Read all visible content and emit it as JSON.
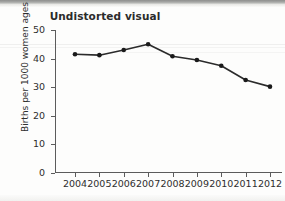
{
  "chart_data": {
    "type": "line",
    "title": "Undistorted visual",
    "xlabel": "",
    "ylabel": "Births per 1000 women ages 15-19",
    "categories": [
      "2004",
      "2005",
      "2006",
      "2007",
      "2008",
      "2009",
      "2010",
      "2011",
      "2012"
    ],
    "values": [
      41.5,
      41.2,
      43.0,
      45.0,
      40.8,
      39.5,
      37.5,
      32.5,
      30.2
    ],
    "ylim": [
      0,
      50
    ],
    "yticks": [
      0,
      10,
      20,
      30,
      40,
      50
    ],
    "ytick_labels": [
      "0",
      "10",
      "20",
      "30",
      "40",
      "50"
    ],
    "grid": false,
    "legend": false,
    "marker": "filled-circle",
    "line_color": "#2b2b2b",
    "marker_color": "#1a1a1a"
  }
}
